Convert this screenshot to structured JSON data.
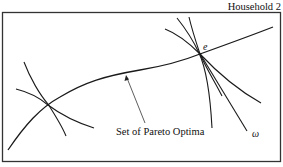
{
  "labels": {
    "household2": "Household 2",
    "endowment_point": "e",
    "omega": "ω",
    "pareto_set": "Set of Pareto Optima"
  },
  "colors": {
    "line": "#1a1a1a",
    "box": "#333333",
    "background": "#ffffff"
  }
}
